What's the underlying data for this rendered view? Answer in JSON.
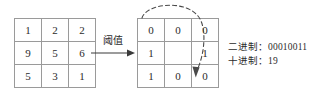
{
  "diagram": {
    "colors": {
      "grid_line": "#9a9a9a",
      "text": "#2b2b2b",
      "arrow": "#3a3a3a",
      "dashed_arrow": "#4a4a4a",
      "background": "#ffffff"
    },
    "source_matrix": {
      "name": "pixel-value-matrix",
      "rows": [
        [
          "1",
          "2",
          "2"
        ],
        [
          "9",
          "5",
          "6"
        ],
        [
          "5",
          "3",
          "1"
        ]
      ]
    },
    "threshold": {
      "label": "阈值",
      "arrow_icon": "right-arrow-icon"
    },
    "binary_matrix": {
      "name": "binary-pattern-matrix",
      "rows": [
        [
          "0",
          "0",
          "0"
        ],
        [
          "1",
          "",
          "1"
        ],
        [
          "1",
          "0",
          "0"
        ]
      ]
    },
    "scan_arrow": {
      "icon": "curved-dashed-arrow-icon"
    },
    "readout": {
      "binary_key": "二进制：",
      "binary_value": "00010011",
      "decimal_key": "十进制：",
      "decimal_value": "19"
    }
  }
}
